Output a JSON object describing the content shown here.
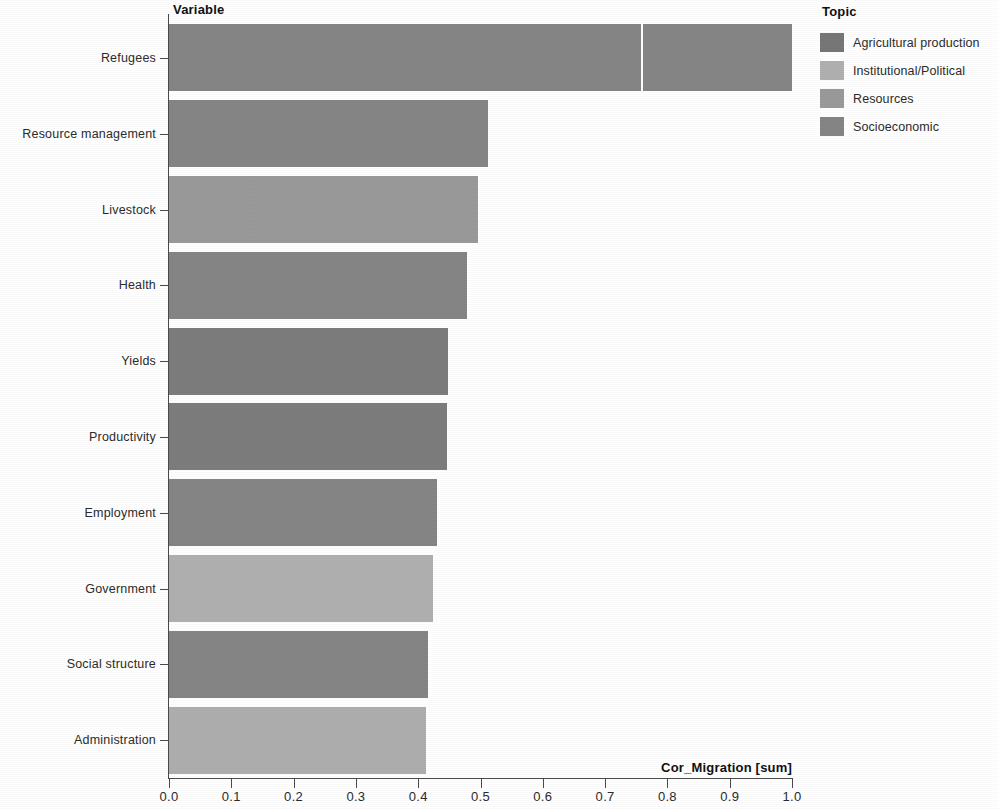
{
  "axes": {
    "y_axis_title": "Variable",
    "x_axis_title": "Cor_Migration [sum]"
  },
  "legend": {
    "title": "Topic",
    "items": [
      {
        "label": "Agricultural production",
        "color": "#777777"
      },
      {
        "label": "Institutional/Political",
        "color": "#b0b0b0"
      },
      {
        "label": "Resources",
        "color": "#9a9a9a"
      },
      {
        "label": "Socioeconomic",
        "color": "#858585"
      }
    ]
  },
  "chart_data": {
    "type": "bar",
    "orientation": "horizontal",
    "stacked": true,
    "title": "",
    "xlabel": "Cor_Migration [sum]",
    "ylabel": "Variable",
    "xlim": [
      0.0,
      1.0
    ],
    "grid": false,
    "legend_position": "right",
    "legend_title": "Topic",
    "xticks": [
      "0.0",
      "0.1",
      "0.2",
      "0.3",
      "0.4",
      "0.5",
      "0.6",
      "0.7",
      "0.8",
      "0.9",
      "1.0"
    ],
    "xtick_values": [
      0.0,
      0.1,
      0.2,
      0.3,
      0.4,
      0.5,
      0.6,
      0.7,
      0.8,
      0.9,
      1.0
    ],
    "categories": [
      "Refugees",
      "Resource management",
      "Livestock",
      "Health",
      "Yields",
      "Productivity",
      "Employment",
      "Government",
      "Social structure",
      "Administration"
    ],
    "values": [
      1.0,
      0.512,
      0.496,
      0.478,
      0.448,
      0.446,
      0.43,
      0.424,
      0.416,
      0.412
    ],
    "bars": [
      {
        "category": "Refugees",
        "total": 1.0,
        "segments": [
          {
            "topic": "Socioeconomic",
            "value": 0.758,
            "color": "#858585"
          },
          {
            "topic": "Socioeconomic",
            "value": 0.242,
            "color": "#858585"
          }
        ]
      },
      {
        "category": "Resource management",
        "total": 0.512,
        "segments": [
          {
            "topic": "Socioeconomic",
            "value": 0.512,
            "color": "#858585"
          }
        ]
      },
      {
        "category": "Livestock",
        "total": 0.496,
        "segments": [
          {
            "topic": "Resources",
            "value": 0.496,
            "color": "#9a9a9a"
          }
        ]
      },
      {
        "category": "Health",
        "total": 0.478,
        "segments": [
          {
            "topic": "Socioeconomic",
            "value": 0.478,
            "color": "#858585"
          }
        ]
      },
      {
        "category": "Yields",
        "total": 0.448,
        "segments": [
          {
            "topic": "Agricultural production",
            "value": 0.448,
            "color": "#7d7d7d"
          }
        ]
      },
      {
        "category": "Productivity",
        "total": 0.446,
        "segments": [
          {
            "topic": "Agricultural production",
            "value": 0.446,
            "color": "#7d7d7d"
          }
        ]
      },
      {
        "category": "Employment",
        "total": 0.43,
        "segments": [
          {
            "topic": "Socioeconomic",
            "value": 0.43,
            "color": "#858585"
          }
        ]
      },
      {
        "category": "Government",
        "total": 0.424,
        "segments": [
          {
            "topic": "Institutional/Political",
            "value": 0.424,
            "color": "#b0b0b0"
          }
        ]
      },
      {
        "category": "Social structure",
        "total": 0.416,
        "segments": [
          {
            "topic": "Socioeconomic",
            "value": 0.416,
            "color": "#858585"
          }
        ]
      },
      {
        "category": "Administration",
        "total": 0.412,
        "segments": [
          {
            "topic": "Institutional/Political",
            "value": 0.412,
            "color": "#aeaeae"
          }
        ]
      }
    ]
  }
}
